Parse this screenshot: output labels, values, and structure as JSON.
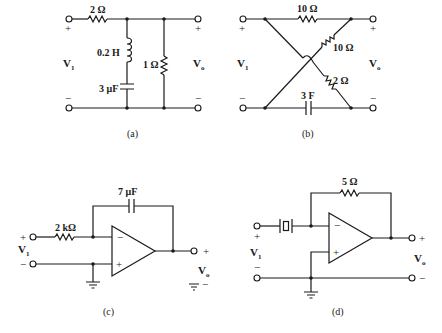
{
  "figure": {
    "a": {
      "caption": "(a)",
      "series_resistor": "2 Ω",
      "inductor": "0.2 H",
      "capacitor": "3 μF",
      "shunt_resistor": "1 Ω",
      "input_label": "V",
      "input_sub": "1",
      "output_label": "V",
      "output_sub": "o",
      "plus": "+",
      "minus": "−"
    },
    "b": {
      "caption": "(b)",
      "top_resistor": "10 Ω",
      "diag_resistor_upper": "10 Ω",
      "diag_resistor_lower": "2 Ω",
      "capacitor": "3 F",
      "input_label": "V",
      "input_sub": "1",
      "output_label": "V",
      "output_sub": "o",
      "plus": "+",
      "minus": "−"
    },
    "c": {
      "caption": "(c)",
      "input_resistor": "2 kΩ",
      "feedback_capacitor": "7 μF",
      "input_label": "V",
      "input_sub": "1",
      "output_label": "V",
      "output_sub": "o",
      "plus": "+",
      "minus": "−",
      "opamp_minus": "−",
      "opamp_plus": "+"
    },
    "d": {
      "caption": "(d)",
      "feedback_resistor": "5 Ω",
      "input_element": "crystal",
      "input_label": "V",
      "input_sub": "1",
      "output_label": "V",
      "output_sub": "o",
      "plus": "+",
      "minus": "−",
      "opamp_minus": "−",
      "opamp_plus": "+"
    }
  }
}
